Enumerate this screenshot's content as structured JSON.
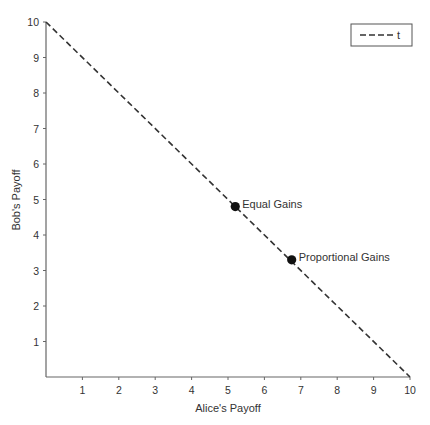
{
  "chart_data": {
    "type": "line",
    "title": "",
    "xlabel": "Alice's Payoff",
    "ylabel": "Bob's Payoff",
    "xlim": [
      0,
      10
    ],
    "ylim": [
      0,
      10
    ],
    "grid": false,
    "legend_position": "top-right",
    "x_ticks": [
      "1",
      "2",
      "3",
      "4",
      "5",
      "6",
      "7",
      "8",
      "9",
      "10"
    ],
    "y_ticks": [
      "1",
      "2",
      "3",
      "4",
      "5",
      "6",
      "7",
      "8",
      "9",
      "10"
    ],
    "series": [
      {
        "name": "t",
        "style": "dashed",
        "color": "#333333",
        "x": [
          0,
          10
        ],
        "y": [
          10,
          0
        ]
      }
    ],
    "points": [
      {
        "label": "Equal Gains",
        "x": 5.2,
        "y": 4.8
      },
      {
        "label": "Proportional Gains",
        "x": 6.75,
        "y": 3.3
      }
    ]
  },
  "legend": {
    "label": "t"
  },
  "axes": {
    "xlabel": "Alice's Payoff",
    "ylabel": "Bob's Payoff"
  }
}
